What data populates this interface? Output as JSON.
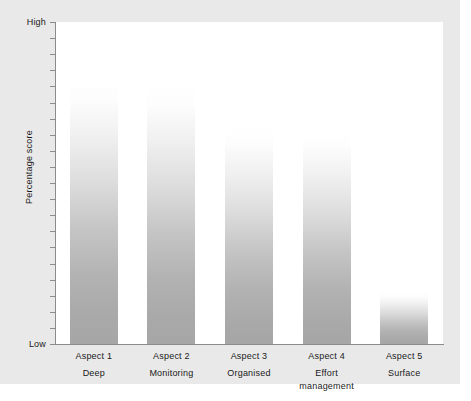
{
  "chart_data": {
    "type": "bar",
    "title": "",
    "xlabel": "",
    "ylabel": "Percentage score",
    "categories": [
      "Aspect 1",
      "Aspect 2",
      "Aspect 3",
      "Aspect 4",
      "Aspect 5"
    ],
    "category_sublabels": [
      "Deep",
      "Monitoring",
      "Organised",
      "Effort management",
      "Surface"
    ],
    "values": [
      83,
      81,
      68,
      67,
      16
    ],
    "ylim": [
      0,
      100
    ],
    "y_tick_labels": [
      "High",
      "Low"
    ],
    "y_axis_high_label": "High",
    "y_axis_low_label": "Low",
    "y_tick_count": 21,
    "grid": false,
    "legend": false,
    "bar_fill": "vertical gradient, white at top to grey at base",
    "colors": {
      "background": "#e9e9e9",
      "plot_area": "#ffffff",
      "axis": "#8b8b8b",
      "bar_top": "#ffffff",
      "bar_bottom": "#a6a6a6",
      "text": "#1a1a1a"
    }
  },
  "axis": {
    "y_title": "Percentage score",
    "high_label": "High",
    "low_label": "Low"
  },
  "bars": [
    {
      "category": "Aspect 1",
      "sublabel": "Deep",
      "value": 83
    },
    {
      "category": "Aspect 2",
      "sublabel": "Monitoring",
      "value": 81
    },
    {
      "category": "Aspect 3",
      "sublabel": "Organised",
      "value": 68
    },
    {
      "category": "Aspect 4",
      "sublabel": "Effort management",
      "value": 67
    },
    {
      "category": "Aspect 5",
      "sublabel": "Surface",
      "value": 16
    }
  ],
  "caption": {
    "text": ""
  }
}
